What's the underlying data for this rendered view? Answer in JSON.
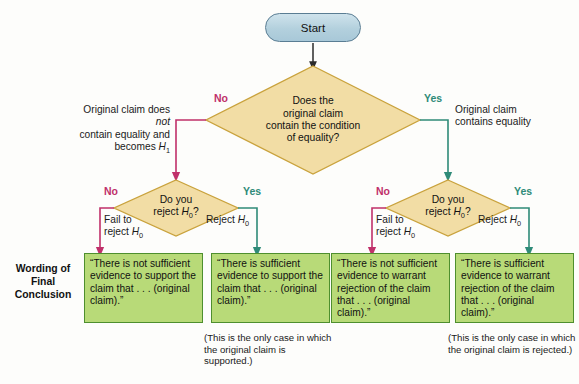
{
  "diagram": {
    "colors": {
      "no_branch": "#c0306a",
      "yes_branch": "#2f8b78",
      "diamond_fill": "#f2dda5",
      "diamond_stroke": "#c9a23c",
      "box_fill": "#b8da78",
      "box_stroke": "#4e8f2e",
      "start_fill": "#b3d0dd",
      "start_stroke": "#5a7d93"
    },
    "start": {
      "label": "Start"
    },
    "decision_top": {
      "line1": "Does the",
      "line2": "original claim",
      "line3": "contain the condition",
      "line4": "of equality?"
    },
    "branch_no_top": {
      "label": "No",
      "note_line1_a": "Original claim does ",
      "note_line1_it": "not",
      "note_line2": "contain equality and",
      "note_line3_a": "becomes ",
      "note_line3_sym": "H",
      "note_line3_sub": "1"
    },
    "branch_yes_top": {
      "label": "Yes",
      "note_line1": "Original claim",
      "note_line2": "contains equality"
    },
    "decision_left": {
      "line1": "Do you",
      "line2_a": "reject ",
      "line2_sym": "H",
      "line2_sub": "0",
      "line2_b": "?"
    },
    "decision_right": {
      "line1": "Do you",
      "line2_a": "reject ",
      "line2_sym": "H",
      "line2_sub": "0",
      "line2_b": "?"
    },
    "left_no": {
      "label": "No",
      "note_line1": "Fail to",
      "note_line2_a": "reject ",
      "note_line2_sym": "H",
      "note_line2_sub": "0"
    },
    "left_yes": {
      "label": "Yes",
      "note_a": "Reject ",
      "note_sym": "H",
      "note_sub": "0"
    },
    "right_no": {
      "label": "No",
      "note_line1": "Fail to",
      "note_line2_a": "reject ",
      "note_line2_sym": "H",
      "note_line2_sub": "0"
    },
    "right_yes": {
      "label": "Yes",
      "note_a": "Reject ",
      "note_sym": "H",
      "note_sub": "0"
    },
    "wording_label": {
      "line1": "Wording of",
      "line2": "Final",
      "line3": "Conclusion"
    },
    "conclusions": [
      {
        "name": "fail-to-reject-not-equality",
        "text": "“There is not sufficient evidence to support the claim that . . . (original claim).”",
        "footnote": ""
      },
      {
        "name": "reject-not-equality",
        "text": "“There is sufficient evidence to support the claim that . . . (original claim).”",
        "footnote": "(This is the only case in which the original claim is supported.)"
      },
      {
        "name": "fail-to-reject-equality",
        "text": "“There is not sufficient evidence to warrant rejection of the claim that . . . (original claim).”",
        "footnote": ""
      },
      {
        "name": "reject-equality",
        "text": "“There is sufficient evidence to warrant rejection of the claim that . . . (original claim).”",
        "footnote": "(This is the only case in which the original claim is rejected.)"
      }
    ]
  }
}
